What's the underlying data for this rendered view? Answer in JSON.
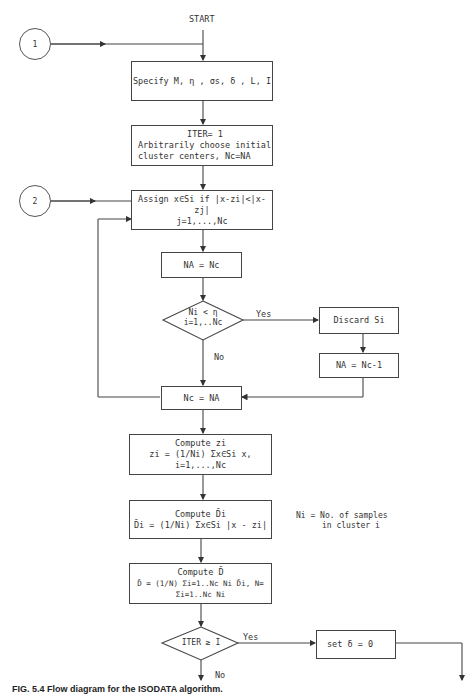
{
  "diagram": {
    "start_label": "START",
    "connectors": [
      {
        "label": "1"
      },
      {
        "label": "2"
      }
    ],
    "boxes": {
      "specify": "Specify M, η , σs, δ , L, I",
      "init_line1": "ITER= 1",
      "init_line2": "Arbitrarily choose initial",
      "init_line3": "cluster centers, Nc=NA",
      "assign_line1": "Assign x∈Si if |x-zi|<|x-zj|",
      "assign_line2": "j=1,...,Nc",
      "na_eq_nc": "NA = Nc",
      "discard": "Discard Si",
      "na_eq_nc_minus_1": "NA = Nc-1",
      "nc_eq_na": "Nc = NA",
      "compute_z_title": "Compute zi",
      "compute_z_formula": "zi = (1/Ni) Σx∈Si x,  i=1,...,Nc",
      "compute_di_title": "Compute D̄i",
      "compute_di_formula": "D̄i = (1/Ni) Σx∈Si |x - zi|",
      "compute_d_title": "Compute D̄",
      "compute_d_formula": "D̄ = (1/N) Σi=1..Nc Ni D̄i,  N= Σi=1..Nc Ni",
      "set_delta": "set δ = 0"
    },
    "decisions": {
      "ni_lt_eta_line1": "Ni < η",
      "ni_lt_eta_line2": "i=1,..Nc",
      "iter_ge_i": "ITER ≥ I"
    },
    "branch_labels": {
      "yes1": "Yes",
      "no1": "No",
      "yes2": "Yes",
      "no2": "No"
    },
    "note_line1": "Ni = No. of samples",
    "note_line2": "in cluster i",
    "caption": "FIG. 5.4  Flow diagram for the ISODATA algorithm."
  }
}
